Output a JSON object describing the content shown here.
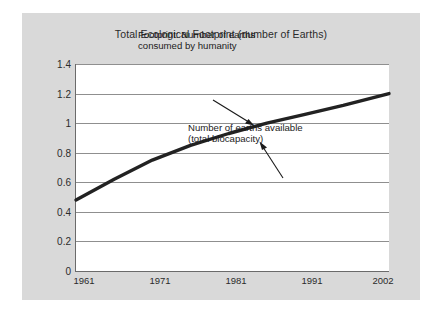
{
  "chart_data": {
    "type": "line",
    "title": "Total Ecological Footprint (number of Earths)",
    "xlabel": "",
    "ylabel": "",
    "x": [
      1961,
      1971,
      1981,
      1991,
      2002
    ],
    "xtick_labels": [
      "1961",
      "1971",
      "1981",
      "1991",
      "2002"
    ],
    "xlim": [
      1961,
      2002
    ],
    "ylim": [
      0,
      1.4
    ],
    "ytick_labels": [
      "0",
      "0.2",
      "0.4",
      "0.6",
      "0.8",
      "1",
      "1.2",
      "1.4"
    ],
    "ytick_values": [
      0,
      0.2,
      0.4,
      0.6,
      0.8,
      1.0,
      1.2,
      1.4
    ],
    "grid": true,
    "legend": "none",
    "series": [
      {
        "name": "Footprint: Number of earths consumed by humanity",
        "color": "#222222",
        "points": [
          {
            "x": 1961,
            "y": 0.48
          },
          {
            "x": 1966,
            "y": 0.62
          },
          {
            "x": 1971,
            "y": 0.75
          },
          {
            "x": 1976,
            "y": 0.85
          },
          {
            "x": 1981,
            "y": 0.93
          },
          {
            "x": 1986,
            "y": 1.0
          },
          {
            "x": 1991,
            "y": 1.06
          },
          {
            "x": 1996,
            "y": 1.12
          },
          {
            "x": 2002,
            "y": 1.2
          }
        ]
      }
    ],
    "annotations": [
      {
        "id": "footprint-label",
        "lines": [
          "Footprint: Number of earths",
          "consumed by humanity"
        ],
        "arrow": "points down-right to curve near 1990"
      },
      {
        "id": "biocapacity-label",
        "lines": [
          "Number of earths available",
          "(total biocapacity)"
        ],
        "arrow": "points up-left to curve near 1988"
      }
    ]
  },
  "colors": {
    "card_background": "#d9d9d9",
    "plot_background": "#ffffff",
    "gridline": "#8f8f8f",
    "axis": "#6b6b6b",
    "curve": "#222222",
    "text": "#2b2b2b"
  }
}
